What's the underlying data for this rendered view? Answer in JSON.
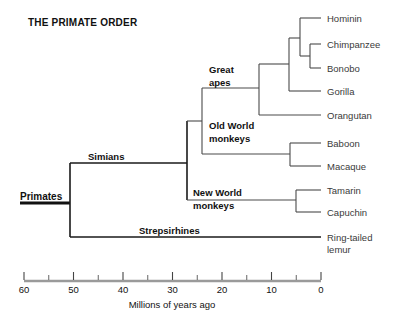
{
  "title": "THE PRIMATE ORDER",
  "axis": {
    "label": "Millions of years ago",
    "major_ticks": [
      60,
      50,
      40,
      30,
      20,
      10,
      0
    ],
    "minor_ticks": [
      55,
      45,
      35,
      25,
      15,
      5
    ],
    "range": [
      60,
      0
    ],
    "x_left_px": 24,
    "x_right_px": 321,
    "y_px": 281
  },
  "clades": {
    "primates": "Primates",
    "simians": "Simians",
    "strepsirhines": "Strepsirhines",
    "great_apes_line1": "Great",
    "great_apes_line2": "apes",
    "old_world_line1": "Old World",
    "old_world_line2": "monkeys",
    "new_world_line1": "New World",
    "new_world_line2": "monkeys"
  },
  "tips": [
    {
      "name": "hominin",
      "label": "Hominin",
      "label2": "",
      "y": 18
    },
    {
      "name": "chimpanzee",
      "label": "Chimpanzee",
      "label2": "",
      "y": 44
    },
    {
      "name": "bonobo",
      "label": "Bonobo",
      "label2": "",
      "y": 68
    },
    {
      "name": "gorilla",
      "label": "Gorilla",
      "label2": "",
      "y": 91
    },
    {
      "name": "orangutan",
      "label": "Orangutan",
      "label2": "",
      "y": 115
    },
    {
      "name": "baboon",
      "label": "Baboon",
      "label2": "",
      "y": 143
    },
    {
      "name": "macaque",
      "label": "Macaque",
      "label2": "",
      "y": 166
    },
    {
      "name": "tamarin",
      "label": "Tamarin",
      "label2": "",
      "y": 190
    },
    {
      "name": "capuchin",
      "label": "Capuchin",
      "label2": "",
      "y": 212
    },
    {
      "name": "ringtailed-lemur",
      "label": "Ring-tailed",
      "label2": "lemur",
      "y": 237
    }
  ],
  "chart_data": {
    "type": "diagram",
    "subtype": "phylogenetic-cladogram",
    "title": "THE PRIMATE ORDER",
    "xlabel": "Millions of years ago",
    "xlim": [
      60,
      0
    ],
    "x_tick_labels": [
      "60",
      "50",
      "40",
      "30",
      "20",
      "10",
      "0"
    ],
    "taxa": [
      "Hominin",
      "Chimpanzee",
      "Bonobo",
      "Gorilla",
      "Orangutan",
      "Baboon",
      "Macaque",
      "Tamarin",
      "Capuchin",
      "Ring-tailed lemur"
    ],
    "internal_nodes": [
      {
        "name": "Primates",
        "divergence_mya": 50,
        "children": [
          "Simians",
          "Strepsirhines"
        ]
      },
      {
        "name": "Simians",
        "divergence_mya": 36,
        "children": [
          "Catarrhines",
          "New World monkeys"
        ]
      },
      {
        "name": "Catarrhines",
        "divergence_mya": 31,
        "children": [
          "Great apes",
          "Old World monkeys"
        ]
      },
      {
        "name": "Great apes",
        "divergence_mya": 20,
        "children": [
          "African apes",
          "Orangutan"
        ]
      },
      {
        "name": "African apes",
        "divergence_mya": 13,
        "children": [
          "Hominin-Pan",
          "Gorilla"
        ]
      },
      {
        "name": "Hominin-Pan",
        "divergence_mya": 7,
        "children": [
          "Hominin",
          "Pan"
        ]
      },
      {
        "name": "Pan",
        "divergence_mya": 3,
        "children": [
          "Chimpanzee",
          "Bonobo"
        ]
      },
      {
        "name": "Old World monkeys",
        "divergence_mya": 6,
        "children": [
          "Baboon",
          "Macaque"
        ]
      },
      {
        "name": "New World monkeys",
        "divergence_mya": 6,
        "children": [
          "Tamarin",
          "Capuchin"
        ]
      }
    ]
  }
}
